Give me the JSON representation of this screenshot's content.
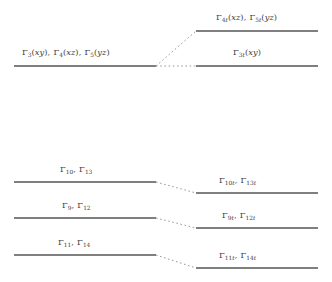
{
  "diagram": {
    "type": "energy-level-correlation",
    "title": "",
    "line_color": "#555555",
    "connector_color": "#9a9a9a",
    "text_color": "#3c3c3c",
    "background": "#ffffff",
    "width": 332,
    "height": 282
  },
  "levels": {
    "left": [
      {
        "id": "left-upper",
        "label": "Γ₃(xy), Γ₄(xz), Γ₅(yz)",
        "terms": [
          {
            "symbol": "Γ",
            "subscript": "3",
            "orbital": "xy"
          },
          {
            "symbol": "Γ",
            "subscript": "4",
            "orbital": "xz"
          },
          {
            "symbol": "Γ",
            "subscript": "5",
            "orbital": "yz"
          }
        ],
        "x_start": 14,
        "x_end": 156,
        "y": 66
      },
      {
        "id": "left-10-13",
        "label": "Γ₁₀, Γ₁₃",
        "terms": [
          {
            "symbol": "Γ",
            "subscript": "10",
            "orbital": ""
          },
          {
            "symbol": "Γ",
            "subscript": "13",
            "orbital": ""
          }
        ],
        "x_start": 14,
        "x_end": 156,
        "y": 182
      },
      {
        "id": "left-9-12",
        "label": "Γ₉, Γ₁₂",
        "terms": [
          {
            "symbol": "Γ",
            "subscript": "9",
            "orbital": ""
          },
          {
            "symbol": "Γ",
            "subscript": "12",
            "orbital": ""
          }
        ],
        "x_start": 14,
        "x_end": 156,
        "y": 218
      },
      {
        "id": "left-11-14",
        "label": "Γ₁₁, Γ₁₄",
        "terms": [
          {
            "symbol": "Γ",
            "subscript": "11",
            "orbital": ""
          },
          {
            "symbol": "Γ",
            "subscript": "14",
            "orbital": ""
          }
        ],
        "x_start": 14,
        "x_end": 156,
        "y": 255
      }
    ],
    "right": [
      {
        "id": "right-4t-5t",
        "label": "Γ₄t(xz), Γ₅t(yz)",
        "terms": [
          {
            "symbol": "Γ",
            "subscript": "4t",
            "orbital": "xz"
          },
          {
            "symbol": "Γ",
            "subscript": "5t",
            "orbital": "yz"
          }
        ],
        "x_start": 196,
        "x_end": 318,
        "y": 31
      },
      {
        "id": "right-3t",
        "label": "Γ₃t(xy)",
        "terms": [
          {
            "symbol": "Γ",
            "subscript": "3t",
            "orbital": "xy"
          }
        ],
        "x_start": 196,
        "x_end": 318,
        "y": 66
      },
      {
        "id": "right-10t-13t",
        "label": "Γ₁₀t, Γ₁₃t",
        "terms": [
          {
            "symbol": "Γ",
            "subscript": "10t",
            "orbital": ""
          },
          {
            "symbol": "Γ",
            "subscript": "13t",
            "orbital": ""
          }
        ],
        "x_start": 196,
        "x_end": 318,
        "y": 193
      },
      {
        "id": "right-9t-12t",
        "label": "Γ₉t, Γ₁₂t",
        "terms": [
          {
            "symbol": "Γ",
            "subscript": "9t",
            "orbital": ""
          },
          {
            "symbol": "Γ",
            "subscript": "12t",
            "orbital": ""
          }
        ],
        "x_start": 196,
        "x_end": 318,
        "y": 228
      },
      {
        "id": "right-11t-14t",
        "label": "Γ₁₁t, Γ₁₄t",
        "terms": [
          {
            "symbol": "Γ",
            "subscript": "11t",
            "orbital": ""
          },
          {
            "symbol": "Γ",
            "subscript": "14t",
            "orbital": ""
          }
        ],
        "x_start": 196,
        "x_end": 318,
        "y": 268
      }
    ],
    "connectors": [
      {
        "id": "conn-upper-rise",
        "from": [
          156,
          66
        ],
        "to": [
          196,
          31
        ]
      },
      {
        "id": "conn-upper-flat",
        "from": [
          156,
          66
        ],
        "to": [
          196,
          66
        ]
      },
      {
        "id": "conn-10-13",
        "from": [
          156,
          182
        ],
        "to": [
          196,
          193
        ]
      },
      {
        "id": "conn-9-12",
        "from": [
          156,
          218
        ],
        "to": [
          196,
          228
        ]
      },
      {
        "id": "conn-11-14",
        "from": [
          156,
          255
        ],
        "to": [
          196,
          268
        ]
      }
    ]
  },
  "labels": {
    "left_upper": {
      "x": 22,
      "y": 54
    },
    "left_10_13": {
      "x": 58,
      "y": 170
    },
    "left_9_12": {
      "x": 58,
      "y": 206
    },
    "left_11_14": {
      "x": 55,
      "y": 243
    },
    "right_4t_5t": {
      "x": 215,
      "y": 19
    },
    "right_3t": {
      "x": 232,
      "y": 54
    },
    "right_10t_13t": {
      "x": 218,
      "y": 181
    },
    "right_9t_12t": {
      "x": 220,
      "y": 216
    },
    "right_11t_14t": {
      "x": 218,
      "y": 256
    }
  }
}
